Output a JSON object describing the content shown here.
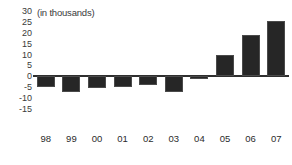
{
  "chart_data": {
    "type": "bar",
    "title": "(in thousands)",
    "xlabel": "",
    "ylabel": "",
    "categories": [
      "98",
      "99",
      "00",
      "01",
      "02",
      "03",
      "04",
      "05",
      "06",
      "07"
    ],
    "values": [
      -5,
      -7,
      -5.5,
      -5,
      -4,
      -7,
      -1,
      10,
      19,
      25.5
    ],
    "ylim": [
      -15,
      30
    ],
    "yticks": [
      30,
      25,
      20,
      15,
      10,
      5,
      0,
      -5,
      -10,
      -15
    ],
    "ytick_labels": [
      "30",
      "25",
      "20",
      "15",
      "10",
      "5",
      "0",
      "-5",
      "-10",
      "-15"
    ],
    "grid": false,
    "legend": false,
    "bar_color": "#262626",
    "axis_color": "#2f2f2f",
    "text_color": "#2b2b2b"
  }
}
